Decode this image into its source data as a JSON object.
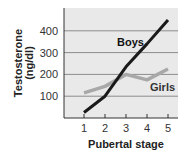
{
  "chart_data": {
    "type": "line",
    "title": "",
    "xlabel": "Pubertal stage",
    "ylabel": "Testosterone (ng/dl)",
    "ylabel_line1": "Testosterone",
    "ylabel_line2": "(ng/dl)",
    "x": [
      1,
      2,
      3,
      4,
      5
    ],
    "x_tick_labels": [
      "1",
      "2",
      "3",
      "4",
      "5"
    ],
    "y_ticks": [
      100,
      200,
      300,
      400
    ],
    "y_tick_labels": [
      "100",
      "200",
      "300",
      "400"
    ],
    "ylim": [
      0,
      500
    ],
    "grid": true,
    "legend": "inline labels",
    "series": [
      {
        "name": "Boys",
        "values": [
          25,
          100,
          235,
          340,
          450
        ],
        "color": "#1a1a1a"
      },
      {
        "name": "Girls",
        "values": [
          115,
          145,
          200,
          175,
          225
        ],
        "color": "#a8a8a8"
      }
    ]
  },
  "colors": {
    "plot_background": "#e9e9e9",
    "gridline": "#8c8c8c",
    "axis": "#333333"
  }
}
